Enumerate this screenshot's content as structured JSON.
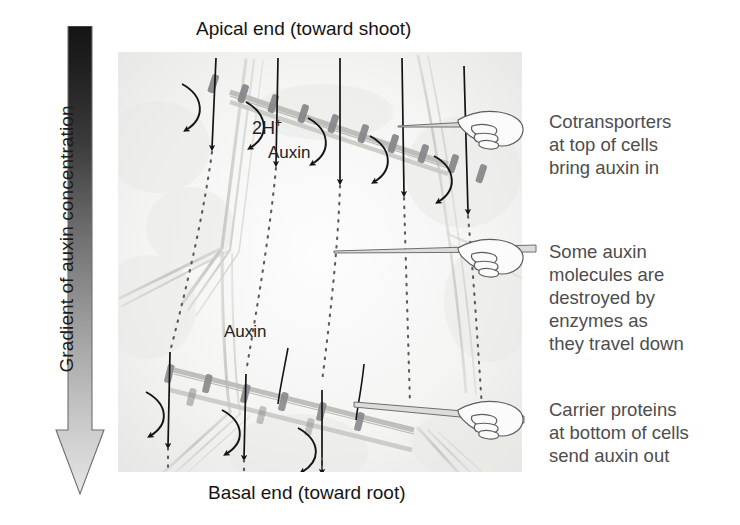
{
  "figure": {
    "apical_caption": "Apical end (toward shoot)",
    "basal_caption": "Basal end (toward root)"
  },
  "gradient_axis": {
    "label": "Gradient of auxin concentration",
    "arrow_direction": "down",
    "top_color": "#1c1c1c",
    "bottom_color": "#e2e2e2",
    "meaning": "high auxin concentration at top (apical), low at bottom (basal)"
  },
  "molecule_labels": {
    "protons": "2H",
    "protons_charge": "+",
    "auxin_top": "Auxin",
    "auxin_bottom": "Auxin"
  },
  "annotations": [
    {
      "id": "cotransporters",
      "lines": [
        "Cotransporters",
        "at top of cells",
        "bring auxin in"
      ],
      "pointer": "pointing-hand"
    },
    {
      "id": "enzymatic-destruction",
      "lines": [
        "Some auxin",
        "molecules are",
        "destroyed by",
        "enzymes as",
        "they travel down"
      ],
      "pointer": "pointing-hand"
    },
    {
      "id": "carrier-proteins",
      "lines": [
        "Carrier proteins",
        "at bottom of cells",
        "send auxin out"
      ],
      "pointer": "pointing-hand"
    }
  ],
  "micrograph": {
    "description": "Light micrograph of plant cells with overlaid transport arrows",
    "background_color": "#f4f4f3",
    "membrane_color": "#b5b5b3",
    "transporter_color": "#7b7b79",
    "arrow_color": "#1a1a1a",
    "dotted_path_color": "#5a5a5a",
    "apical_transporter_count": 10,
    "basal_transporter_count": 9,
    "uptake_arrow_count": 5,
    "efflux_arrow_count": 3,
    "dotted_path_count": 5
  }
}
